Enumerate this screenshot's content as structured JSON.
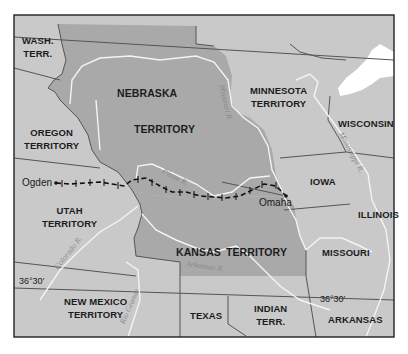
{
  "map": {
    "colors": {
      "page_background": "#ffffff",
      "land": "#c9c9c9",
      "highlighted_territory": "#a9a9a9",
      "water": "#ffffff",
      "rivers": "#f2f2f2",
      "borders": "#555555",
      "frame": "#222222",
      "railroad": "#111111"
    },
    "regions": [
      {
        "id": "wash-terr",
        "lines": [
          "WASH.",
          "TERR."
        ]
      },
      {
        "id": "oregon-territory",
        "lines": [
          "OREGON",
          "TERRITORY"
        ]
      },
      {
        "id": "nebraska-territory",
        "lines": [
          "NEBRASKA",
          "TERRITORY"
        ],
        "highlighted": true
      },
      {
        "id": "minnesota-territory",
        "lines": [
          "MINNESOTA",
          "TERRITORY"
        ]
      },
      {
        "id": "wisconsin",
        "lines": [
          "WISCONSIN"
        ]
      },
      {
        "id": "iowa",
        "lines": [
          "IOWA"
        ]
      },
      {
        "id": "illinois",
        "lines": [
          "ILLINOIS"
        ]
      },
      {
        "id": "utah-territory",
        "lines": [
          "UTAH",
          "TERRITORY"
        ]
      },
      {
        "id": "kansas-territory",
        "lines": [
          "KANSAS",
          "TERRITORY"
        ],
        "highlighted": true
      },
      {
        "id": "missouri",
        "lines": [
          "MISSOURI"
        ]
      },
      {
        "id": "new-mexico-territory",
        "lines": [
          "NEW MEXICO",
          "TERRITORY"
        ]
      },
      {
        "id": "texas",
        "lines": [
          "TEXAS"
        ]
      },
      {
        "id": "indian-terr",
        "lines": [
          "INDIAN",
          "TERR."
        ]
      },
      {
        "id": "arkansas",
        "lines": [
          "ARKANSAS"
        ]
      }
    ],
    "cities": [
      {
        "id": "ogden",
        "name": "Ogden"
      },
      {
        "id": "omaha",
        "name": "Omaha"
      }
    ],
    "rivers": [
      {
        "id": "missouri-river",
        "name": "Missouri R."
      },
      {
        "id": "platte-river",
        "name": "Platte R."
      },
      {
        "id": "mississippi-river",
        "name": "Mississippi R."
      },
      {
        "id": "colorado-river",
        "name": "Colorado R."
      },
      {
        "id": "arkansas-river",
        "name": "Arkansas R."
      },
      {
        "id": "rio-grande",
        "name": "Rio Grande"
      }
    ],
    "latitude_labels": [
      {
        "id": "lat-west",
        "text": "36°30′"
      },
      {
        "id": "lat-east",
        "text": "36°30′"
      }
    ],
    "railroad": {
      "from": "Omaha",
      "to": "Ogden"
    }
  }
}
